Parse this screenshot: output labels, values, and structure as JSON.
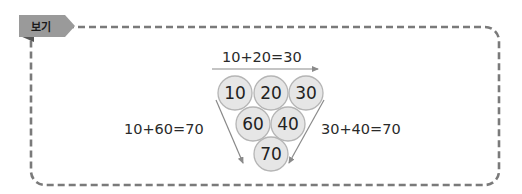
{
  "tag": {
    "label": "보기"
  },
  "colors": {
    "border": "#7a7a7a",
    "tag_fill": "#9a9a9a",
    "tag_fold": "#555555",
    "circle_fill": "#e6e6e6",
    "circle_stroke": "#b5b5b5",
    "arrow": "#8a8a8a",
    "text": "#222222"
  },
  "diagram": {
    "top_equation": "10+20=30",
    "left_equation": "10+60=70",
    "right_equation": "30+40=70",
    "circles": [
      {
        "value": "10",
        "row": 1
      },
      {
        "value": "20",
        "row": 1
      },
      {
        "value": "30",
        "row": 1
      },
      {
        "value": "60",
        "row": 2
      },
      {
        "value": "40",
        "row": 2
      },
      {
        "value": "70",
        "row": 3
      }
    ]
  }
}
